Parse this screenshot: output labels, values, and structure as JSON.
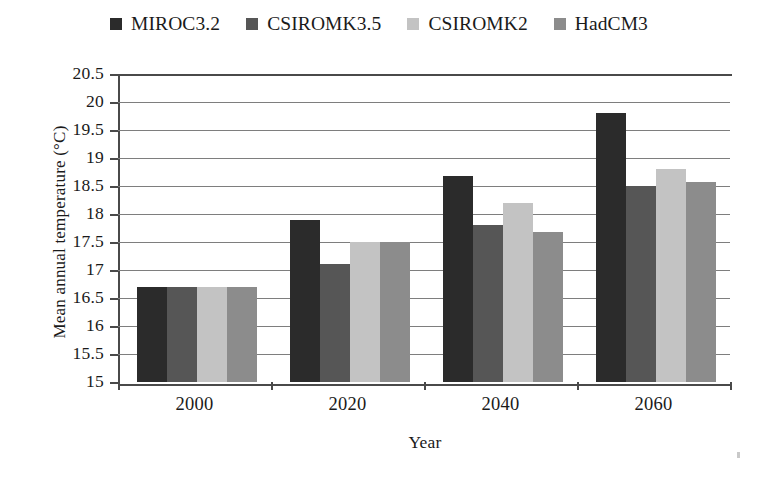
{
  "chart_data": {
    "type": "bar",
    "title": "",
    "xlabel": "Year",
    "ylabel": "Mean annual temperature (°C)",
    "categories": [
      "2000",
      "2020",
      "2040",
      "2060"
    ],
    "ylim": [
      15,
      20.5
    ],
    "ytick_labels": [
      "20.5",
      "20",
      "19.5",
      "19",
      "18.5",
      "18",
      "17.5",
      "17",
      "16.5",
      "16",
      "15.5",
      "15"
    ],
    "ytick_values": [
      20.5,
      20,
      19.5,
      19,
      18.5,
      18,
      17.5,
      17,
      16.5,
      16,
      15.5,
      15
    ],
    "grid": true,
    "legend_position": "top-center",
    "series": [
      {
        "name": "MIROC3.2",
        "color": "#2b2b2b",
        "values": [
          16.7,
          17.9,
          18.67,
          19.8
        ]
      },
      {
        "name": "CSIROMK3.5",
        "color": "#565656",
        "values": [
          16.7,
          17.1,
          17.8,
          18.5
        ]
      },
      {
        "name": "CSIROMK2",
        "color": "#c3c3c3",
        "values": [
          16.7,
          17.5,
          18.2,
          18.8
        ]
      },
      {
        "name": "HadCM3",
        "color": "#8c8c8c",
        "values": [
          16.7,
          17.5,
          17.67,
          18.57
        ]
      }
    ]
  }
}
